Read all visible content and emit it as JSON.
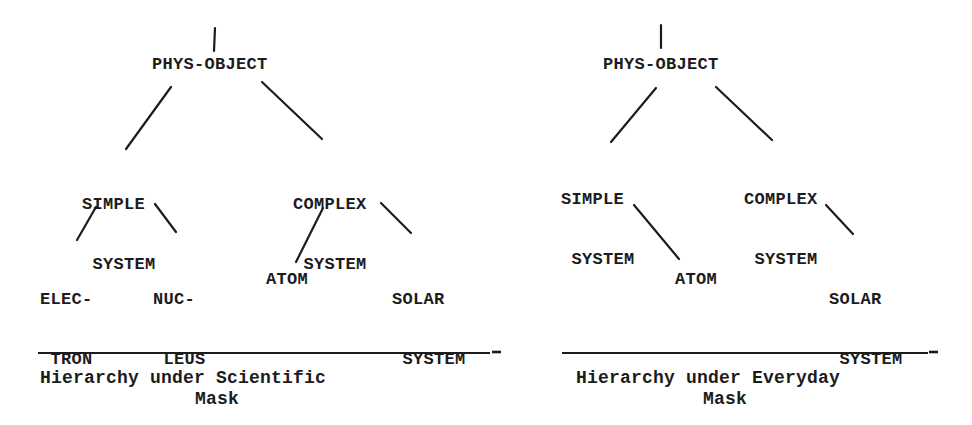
{
  "diagrams": [
    {
      "id": "scientific",
      "root": "PHYS-OBJECT",
      "nodes": {
        "simple_system": {
          "line1": "SIMPLE",
          "line2": " SYSTEM"
        },
        "complex_system": {
          "line1": "COMPLEX",
          "line2": " SYSTEM"
        },
        "electron": {
          "line1": "ELEC-",
          "line2": " TRON"
        },
        "nucleus": {
          "line1": "NUC-",
          "line2": " LEUS"
        },
        "atom": {
          "line1": "ATOM"
        },
        "solar_system": {
          "line1": "SOLAR",
          "line2": " SYSTEM"
        }
      },
      "edges": [
        [
          "PHYS-OBJECT",
          "SIMPLE SYSTEM"
        ],
        [
          "PHYS-OBJECT",
          "COMPLEX SYSTEM"
        ],
        [
          "SIMPLE SYSTEM",
          "ELECTRON"
        ],
        [
          "SIMPLE SYSTEM",
          "NUCLEUS"
        ],
        [
          "COMPLEX SYSTEM",
          "ATOM"
        ],
        [
          "COMPLEX SYSTEM",
          "SOLAR SYSTEM"
        ]
      ],
      "caption": {
        "line1": "Hierarchy under Scientific",
        "line2": "Mask"
      }
    },
    {
      "id": "everyday",
      "root": "PHYS-OBJECT",
      "nodes": {
        "simple_system": {
          "line1": "SIMPLE",
          "line2": " SYSTEM"
        },
        "complex_system": {
          "line1": "COMPLEX",
          "line2": " SYSTEM"
        },
        "atom": {
          "line1": "ATOM"
        },
        "solar_system": {
          "line1": "SOLAR",
          "line2": " SYSTEM"
        }
      },
      "edges": [
        [
          "PHYS-OBJECT",
          "SIMPLE SYSTEM"
        ],
        [
          "PHYS-OBJECT",
          "COMPLEX SYSTEM"
        ],
        [
          "SIMPLE SYSTEM",
          "ATOM"
        ],
        [
          "COMPLEX SYSTEM",
          "SOLAR SYSTEM"
        ]
      ],
      "caption": {
        "line1": "Hierarchy under Everyday",
        "line2": "Mask"
      }
    }
  ],
  "colors": {
    "ink": "#1c1c1c",
    "background": "#ffffff"
  }
}
